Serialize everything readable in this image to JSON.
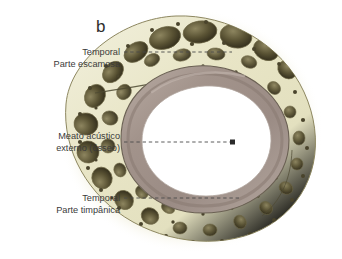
{
  "figure": {
    "panel_letter": "b",
    "background_color": "#ffffff",
    "palette": {
      "bone_matrix": "#e9e6c9",
      "bone_matrix_light": "#f2f0dc",
      "bone_halo": "#f0eed6",
      "cavity_dark": "#3f3a26",
      "cavity_mid": "#7d7552",
      "canal_lining": "#a89a92",
      "canal_lining_dark": "#8c7d77",
      "canal_lumen": "#ffffff",
      "outline": "#5c5638",
      "leader_line": "#4a4a4a",
      "text": "#3a3a3a"
    }
  },
  "labels": [
    {
      "id": "squamous",
      "line1": "Temporal",
      "line2": "Parte escamosa",
      "leader": {
        "type": "dashed",
        "from_x": 124,
        "to_x": 232,
        "y": 52,
        "endpoint": "none"
      }
    },
    {
      "id": "meatus",
      "line1": "Meato acústico",
      "line2": "externo (ósseo)",
      "leader": {
        "type": "dashed",
        "from_x": 124,
        "to_x": 233,
        "y": 142,
        "endpoint": "dot"
      }
    },
    {
      "id": "tympanic",
      "line1": "Temporal",
      "line2": "Parte timpânica",
      "leader": {
        "type": "dashed",
        "from_x": 124,
        "to_x": 240,
        "y": 198,
        "endpoint": "none"
      }
    }
  ]
}
